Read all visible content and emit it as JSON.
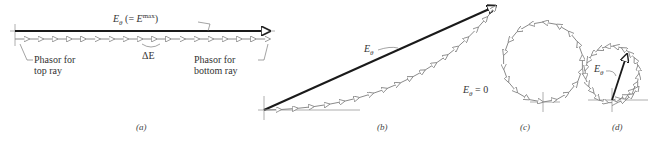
{
  "figure": {
    "panels": [
      {
        "id": "a",
        "caption": "(a)",
        "labels": {
          "resultant": "E",
          "resultant_sub": "θ",
          "resultant_note_pre": " (= ",
          "resultant_note_E": "E",
          "resultant_note_sup": "max",
          "resultant_note_post": ")",
          "delta": "ΔE",
          "top_phasor": [
            "Phasor for",
            "top ray"
          ],
          "bottom_phasor": [
            "Phasor for",
            "bottom ray"
          ]
        }
      },
      {
        "id": "b",
        "caption": "(b)",
        "labels": {
          "resultant": "E",
          "resultant_sub": "θ"
        }
      },
      {
        "id": "c",
        "caption": "(c)",
        "labels": {
          "resultant": "E",
          "resultant_sub": "θ",
          "value": " = 0"
        }
      },
      {
        "id": "d",
        "caption": "(d)",
        "labels": {
          "resultant": "E",
          "resultant_sub": "θ"
        }
      }
    ],
    "colors": {
      "resultant": "#1a1a1a",
      "phasor": "#8a8a8a",
      "axis": "#9a9a9a",
      "text": "#333333"
    }
  }
}
